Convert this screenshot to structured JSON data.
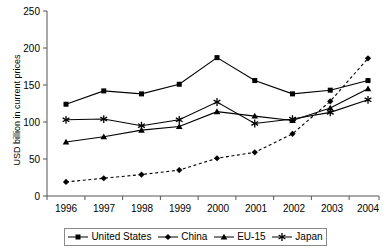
{
  "chart_data": {
    "type": "line",
    "title": "",
    "subtitle": "",
    "xlabel": "",
    "ylabel": "USD billion in current prices",
    "categories": [
      "1996",
      "1997",
      "1998",
      "1999",
      "2000",
      "2001",
      "2002",
      "2003",
      "2004"
    ],
    "x": [
      1996,
      1997,
      1998,
      1999,
      2000,
      2001,
      2002,
      2003,
      2004
    ],
    "ylim": [
      0,
      250
    ],
    "yticks": [
      0,
      50,
      100,
      150,
      200,
      250
    ],
    "ytick_labels": [
      "0",
      "50",
      "100",
      "150",
      "200",
      "250"
    ],
    "grid": false,
    "legend_position": "bottom",
    "series": [
      {
        "name": "United States",
        "marker": "square",
        "line_style": "solid",
        "color": "#000000",
        "values": [
          124,
          142,
          138,
          151,
          187,
          156,
          138,
          143,
          156
        ]
      },
      {
        "name": "China",
        "marker": "diamond",
        "line_style": "dashed",
        "color": "#000000",
        "values": [
          19,
          24,
          29,
          35,
          51,
          59,
          84,
          128,
          186
        ]
      },
      {
        "name": "EU-15",
        "marker": "triangle",
        "line_style": "solid",
        "color": "#000000",
        "values": [
          73,
          80,
          89,
          94,
          114,
          108,
          102,
          119,
          145
        ]
      },
      {
        "name": "Japan",
        "marker": "asterisk",
        "line_style": "solid",
        "color": "#000000",
        "values": [
          103,
          104,
          95,
          103,
          127,
          98,
          104,
          113,
          130
        ]
      }
    ]
  },
  "axis": {
    "y_label": "USD billion in current prices",
    "y_ticks": [
      "250",
      "200",
      "150",
      "100",
      "50",
      "0"
    ],
    "x_ticks": [
      "1996",
      "1997",
      "1998",
      "1999",
      "2000",
      "2001",
      "2002",
      "2003",
      "2004"
    ]
  },
  "legend": {
    "items": [
      {
        "label": "United States",
        "marker": "square"
      },
      {
        "label": "China",
        "marker": "diamond"
      },
      {
        "label": "EU-15",
        "marker": "triangle"
      },
      {
        "label": "Japan",
        "marker": "asterisk"
      }
    ]
  },
  "colors": {
    "ink": "#000000",
    "axis": "#555555",
    "legend_border": "#8a8a8a"
  }
}
